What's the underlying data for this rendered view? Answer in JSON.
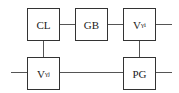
{
  "diagram": {
    "nodes": [
      {
        "id": "cl",
        "label": "CL",
        "sub": ""
      },
      {
        "id": "gb",
        "label": "GB",
        "sub": ""
      },
      {
        "id": "v_gamma_i",
        "label": "V",
        "sub": "γi"
      },
      {
        "id": "v_gamma_j",
        "label": "V",
        "sub": "γj"
      },
      {
        "id": "pg",
        "label": "PG",
        "sub": ""
      }
    ],
    "edges": [
      {
        "from": "cl",
        "to": "gb"
      },
      {
        "from": "gb",
        "to": "v_gamma_i"
      },
      {
        "from": "v_gamma_i",
        "to": "output-right-top"
      },
      {
        "from": "cl",
        "to": "v_gamma_j"
      },
      {
        "from": "v_gamma_i",
        "to": "pg"
      },
      {
        "from": "input-left-bottom",
        "to": "v_gamma_j"
      },
      {
        "from": "v_gamma_j",
        "to": "pg"
      },
      {
        "from": "pg",
        "to": "output-right-bottom"
      }
    ],
    "colors": {
      "stroke": "#333333",
      "background": "#ffffff"
    }
  }
}
